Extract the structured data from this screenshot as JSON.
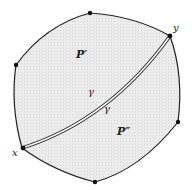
{
  "diagram": {
    "type": "polygon-partition",
    "regions": [
      {
        "label": "P′",
        "x": 78,
        "y": 56
      },
      {
        "label": "P″",
        "x": 118,
        "y": 135
      }
    ],
    "curve": {
      "label_upper": "γ",
      "label_lower": "γ"
    },
    "endpoints": {
      "start": "x",
      "end": "y"
    },
    "colors": {
      "fill": "#e8e8e8",
      "stroke": "#222222",
      "dot": "#111111",
      "curve_inner": "#ffffff"
    }
  }
}
